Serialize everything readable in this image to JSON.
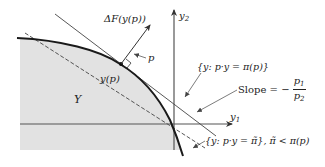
{
  "diagram": {
    "axes": {
      "x_label": "y",
      "x_label_sub": "1",
      "y_label": "y",
      "y_label_sub": "2"
    },
    "region_label": "Y",
    "point_label": "y(p)",
    "gradient_label": "ΔF(y(p))",
    "price_vector_label": "p",
    "isoprofit_max_label": "{y: p·y = π(p)}",
    "slope_label": {
      "prefix": "Slope = −",
      "numerator": "p",
      "numerator_sub": "1",
      "denominator": "p",
      "denominator_sub": "2"
    },
    "isoprofit_low_label": "{y: p·y = π̃}, π̃ < π(p)",
    "colors": {
      "region_fill": "#e2e2e2",
      "curve": "#1a1a1a",
      "lines": "#444444",
      "axes": "#555555"
    }
  }
}
